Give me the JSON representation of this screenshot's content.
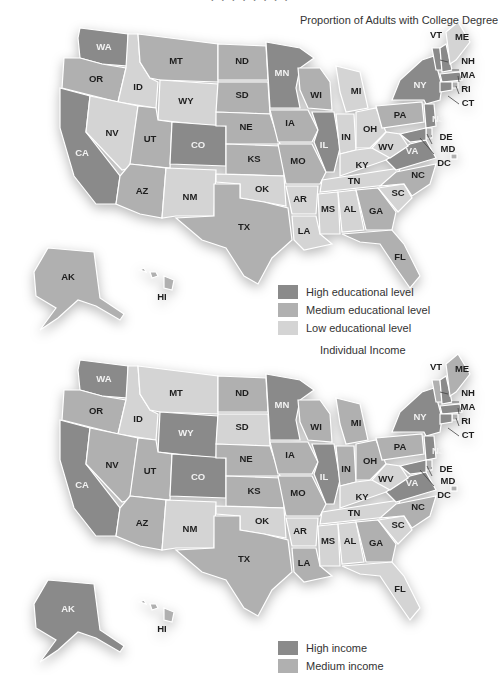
{
  "colors": {
    "high": "#8a8a8a",
    "medium": "#b0b0b0",
    "low": "#d4d4d4",
    "label_dark": "#1e1e1e",
    "label_light": "#f2f2f2"
  },
  "maps": [
    {
      "title": "Proportion of Adults with College Degree",
      "legend": [
        {
          "key": "high",
          "label": "High educational level"
        },
        {
          "key": "medium",
          "label": "Medium educational level"
        },
        {
          "key": "low",
          "label": "Low educational level"
        }
      ],
      "states": {
        "WA": "high",
        "OR": "medium",
        "CA": "high",
        "ID": "low",
        "NV": "low",
        "MT": "medium",
        "WY": "low",
        "UT": "medium",
        "AZ": "medium",
        "CO": "high",
        "NM": "low",
        "ND": "medium",
        "SD": "medium",
        "NE": "medium",
        "KS": "medium",
        "OK": "low",
        "TX": "medium",
        "MN": "high",
        "IA": "medium",
        "MO": "medium",
        "AR": "low",
        "LA": "low",
        "WI": "medium",
        "IL": "high",
        "MI": "low",
        "IN": "low",
        "OH": "low",
        "KY": "low",
        "TN": "low",
        "MS": "low",
        "AL": "low",
        "GA": "medium",
        "FL": "medium",
        "SC": "low",
        "NC": "medium",
        "VA": "high",
        "WV": "low",
        "PA": "medium",
        "NY": "high",
        "VT": "high",
        "NH": "high",
        "ME": "low",
        "MA": "high",
        "RI": "medium",
        "CT": "high",
        "NJ": "high",
        "DE": "medium",
        "MD": "high",
        "DC": "medium",
        "AK": "medium",
        "HI": "medium"
      }
    },
    {
      "title": "Individual Income",
      "legend": [
        {
          "key": "high",
          "label": "High income"
        },
        {
          "key": "medium",
          "label": "Medium income"
        }
      ],
      "states": {
        "WA": "high",
        "OR": "medium",
        "CA": "high",
        "ID": "low",
        "NV": "medium",
        "MT": "low",
        "WY": "high",
        "UT": "medium",
        "AZ": "medium",
        "CO": "high",
        "NM": "low",
        "ND": "medium",
        "SD": "low",
        "NE": "medium",
        "KS": "medium",
        "OK": "low",
        "TX": "medium",
        "MN": "high",
        "IA": "medium",
        "MO": "medium",
        "AR": "low",
        "LA": "medium",
        "WI": "medium",
        "IL": "high",
        "MI": "medium",
        "IN": "medium",
        "OH": "medium",
        "KY": "low",
        "TN": "low",
        "MS": "low",
        "AL": "low",
        "GA": "medium",
        "FL": "low",
        "SC": "low",
        "NC": "medium",
        "VA": "high",
        "WV": "low",
        "PA": "medium",
        "NY": "high",
        "VT": "medium",
        "NH": "high",
        "ME": "medium",
        "MA": "high",
        "RI": "medium",
        "CT": "high",
        "NJ": "high",
        "DE": "medium",
        "MD": "high",
        "DC": "medium",
        "AK": "high",
        "HI": "medium"
      }
    }
  ],
  "chart_data": [
    {
      "type": "heatmap",
      "subtype": "choropleth",
      "title": "Proportion of Adults with College Degree",
      "legend": [
        "High educational level",
        "Medium educational level",
        "Low educational level"
      ],
      "categories": {
        "High educational level": [
          "WA",
          "CA",
          "CO",
          "MN",
          "IL",
          "NY",
          "VT",
          "NH",
          "MA",
          "CT",
          "NJ",
          "MD",
          "VA"
        ],
        "Medium educational level": [
          "OR",
          "MT",
          "UT",
          "AZ",
          "ND",
          "SD",
          "NE",
          "KS",
          "TX",
          "IA",
          "MO",
          "WI",
          "GA",
          "FL",
          "NC",
          "PA",
          "RI",
          "DE",
          "DC",
          "AK",
          "HI"
        ],
        "Low educational level": [
          "ID",
          "NV",
          "WY",
          "NM",
          "OK",
          "AR",
          "LA",
          "MI",
          "IN",
          "OH",
          "KY",
          "TN",
          "MS",
          "AL",
          "SC",
          "WV",
          "ME"
        ]
      }
    },
    {
      "type": "heatmap",
      "subtype": "choropleth",
      "title": "Individual Income",
      "legend": [
        "High income",
        "Medium income"
      ],
      "categories": {
        "High income": [
          "WA",
          "CA",
          "WY",
          "CO",
          "MN",
          "IL",
          "NY",
          "NH",
          "MA",
          "CT",
          "NJ",
          "MD",
          "VA",
          "AK"
        ],
        "Medium income": [
          "OR",
          "NV",
          "UT",
          "AZ",
          "ND",
          "NE",
          "KS",
          "TX",
          "IA",
          "MO",
          "LA",
          "WI",
          "MI",
          "IN",
          "OH",
          "GA",
          "NC",
          "PA",
          "VT",
          "ME",
          "RI",
          "DE",
          "DC",
          "HI"
        ],
        "Low income (legend cut off)": [
          "ID",
          "MT",
          "SD",
          "NM",
          "OK",
          "AR",
          "MS",
          "AL",
          "TN",
          "KY",
          "WV",
          "SC",
          "FL"
        ]
      }
    }
  ]
}
